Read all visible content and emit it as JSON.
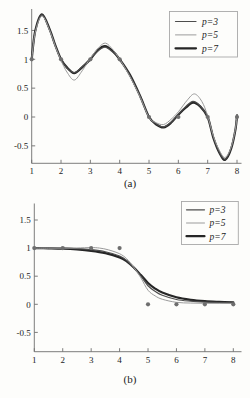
{
  "figure": {
    "background": "#fdfdfb",
    "colors": {
      "axis": "#6e6e6e",
      "tick_text": "#1c1c1c",
      "legend_border": "#a8a8a8",
      "legend_bg": "#fdfdfb",
      "dot": "#6e6e6e"
    }
  },
  "chart_data": [
    {
      "type": "line",
      "title": "",
      "xlabel": "",
      "ylabel": "",
      "caption": "(a)",
      "xlim": [
        1,
        8
      ],
      "ylim": [
        -0.8,
        1.85
      ],
      "grid": false,
      "legend_position": "upper right",
      "x_tick_labels": [
        "1",
        "2",
        "3",
        "4",
        "5",
        "6",
        "7",
        "8"
      ],
      "x_tick_values": [
        1,
        2,
        3,
        4,
        5,
        6,
        7,
        8
      ],
      "y_tick_labels": [
        "-0.5",
        "0",
        "0.5",
        "1",
        "1.5"
      ],
      "y_tick_values": [
        -0.5,
        0,
        0.5,
        1,
        1.5
      ],
      "scatter": {
        "x": [
          1,
          2,
          3,
          4,
          5,
          6,
          7,
          8
        ],
        "y": [
          1,
          1,
          1,
          1,
          0,
          0,
          0,
          0
        ]
      },
      "series": [
        {
          "name": "p=7",
          "color": "#262626",
          "width": 2.2,
          "points": [
            [
              1,
              1.0
            ],
            [
              1.12,
              1.49
            ],
            [
              1.35,
              1.78
            ],
            [
              1.62,
              1.51
            ],
            [
              1.8,
              1.25
            ],
            [
              2,
              1.0
            ],
            [
              2.2,
              0.86
            ],
            [
              2.45,
              0.76
            ],
            [
              2.7,
              0.85
            ],
            [
              3,
              1.0
            ],
            [
              3.25,
              1.16
            ],
            [
              3.5,
              1.23
            ],
            [
              3.75,
              1.15
            ],
            [
              4,
              1.0
            ],
            [
              4.35,
              0.73
            ],
            [
              4.7,
              0.36
            ],
            [
              5,
              0.0
            ],
            [
              5.25,
              -0.13
            ],
            [
              5.5,
              -0.18
            ],
            [
              5.75,
              -0.1
            ],
            [
              6,
              0.04
            ],
            [
              6.25,
              0.16
            ],
            [
              6.5,
              0.25
            ],
            [
              6.75,
              0.18
            ],
            [
              7,
              0.0
            ],
            [
              7.2,
              -0.37
            ],
            [
              7.42,
              -0.64
            ],
            [
              7.6,
              -0.74
            ],
            [
              7.8,
              -0.55
            ],
            [
              7.95,
              -0.21
            ],
            [
              8,
              0.03
            ]
          ]
        },
        {
          "name": "p=3",
          "color": "#4d4d4d",
          "width": 1.2,
          "points": [
            [
              1,
              1.0
            ],
            [
              1.12,
              1.48
            ],
            [
              1.35,
              1.77
            ],
            [
              1.62,
              1.5
            ],
            [
              1.8,
              1.24
            ],
            [
              2,
              1.0
            ],
            [
              2.2,
              0.85
            ],
            [
              2.45,
              0.77
            ],
            [
              2.7,
              0.86
            ],
            [
              3,
              1.01
            ],
            [
              3.25,
              1.14
            ],
            [
              3.5,
              1.21
            ],
            [
              3.75,
              1.13
            ],
            [
              4,
              1.0
            ],
            [
              4.35,
              0.72
            ],
            [
              4.7,
              0.36
            ],
            [
              5,
              0.0
            ],
            [
              5.25,
              -0.12
            ],
            [
              5.5,
              -0.17
            ],
            [
              5.75,
              -0.09
            ],
            [
              6,
              0.05
            ],
            [
              6.25,
              0.18
            ],
            [
              6.5,
              0.27
            ],
            [
              6.75,
              0.19
            ],
            [
              7,
              0.0
            ],
            [
              7.2,
              -0.36
            ],
            [
              7.42,
              -0.63
            ],
            [
              7.6,
              -0.73
            ],
            [
              7.8,
              -0.54
            ],
            [
              7.95,
              -0.2
            ],
            [
              8,
              0.03
            ]
          ]
        },
        {
          "name": "p=5",
          "color": "#9b9b9b",
          "width": 1.0,
          "points": [
            [
              1,
              1.0
            ],
            [
              1.12,
              1.46
            ],
            [
              1.35,
              1.75
            ],
            [
              1.62,
              1.49
            ],
            [
              1.8,
              1.23
            ],
            [
              2,
              0.98
            ],
            [
              2.2,
              0.78
            ],
            [
              2.45,
              0.64
            ],
            [
              2.72,
              0.8
            ],
            [
              3,
              1.02
            ],
            [
              3.3,
              1.21
            ],
            [
              3.52,
              1.28
            ],
            [
              3.76,
              1.17
            ],
            [
              4,
              1.0
            ],
            [
              4.35,
              0.7
            ],
            [
              4.7,
              0.34
            ],
            [
              5,
              -0.01
            ],
            [
              5.25,
              -0.1
            ],
            [
              5.5,
              -0.13
            ],
            [
              5.75,
              -0.04
            ],
            [
              6,
              0.09
            ],
            [
              6.3,
              0.29
            ],
            [
              6.55,
              0.4
            ],
            [
              6.8,
              0.27
            ],
            [
              7,
              0.02
            ],
            [
              7.2,
              -0.34
            ],
            [
              7.42,
              -0.6
            ],
            [
              7.6,
              -0.7
            ],
            [
              7.8,
              -0.52
            ],
            [
              7.95,
              -0.19
            ],
            [
              8,
              0.03
            ]
          ]
        }
      ],
      "legend": [
        {
          "label": "p=3",
          "color": "#4d4d4d",
          "width": 1.2
        },
        {
          "label": "p=5",
          "color": "#9b9b9b",
          "width": 1.0
        },
        {
          "label": "p=7",
          "color": "#262626",
          "width": 2.2
        }
      ]
    },
    {
      "type": "line",
      "title": "",
      "xlabel": "",
      "ylabel": "",
      "caption": "(b)",
      "xlim": [
        1,
        8
      ],
      "ylim": [
        -0.85,
        1.75
      ],
      "grid": false,
      "legend_position": "upper right",
      "x_tick_labels": [
        "1",
        "2",
        "3",
        "4",
        "5",
        "6",
        "7",
        "8"
      ],
      "x_tick_values": [
        1,
        2,
        3,
        4,
        5,
        6,
        7,
        8
      ],
      "y_tick_labels": [
        "-0.5",
        "0",
        "0.5",
        "1",
        "1.5"
      ],
      "y_tick_values": [
        -0.5,
        0,
        0.5,
        1,
        1.5
      ],
      "scatter": {
        "x": [
          1,
          2,
          3,
          4,
          5,
          6,
          7,
          8
        ],
        "y": [
          1,
          1,
          1,
          1,
          0,
          0,
          0,
          0
        ]
      },
      "series": [
        {
          "name": "p=7",
          "color": "#262626",
          "width": 2.2,
          "points": [
            [
              1,
              0.999
            ],
            [
              1.5,
              0.996
            ],
            [
              2,
              0.99
            ],
            [
              2.5,
              0.976
            ],
            [
              3,
              0.952
            ],
            [
              3.5,
              0.91
            ],
            [
              4,
              0.835
            ],
            [
              4.25,
              0.765
            ],
            [
              4.5,
              0.655
            ],
            [
              4.75,
              0.52
            ],
            [
              5,
              0.38
            ],
            [
              5.25,
              0.28
            ],
            [
              5.5,
              0.21
            ],
            [
              6,
              0.125
            ],
            [
              6.5,
              0.08
            ],
            [
              7,
              0.055
            ],
            [
              7.5,
              0.042
            ],
            [
              8,
              0.033
            ]
          ]
        },
        {
          "name": "p=3",
          "color": "#4d4d4d",
          "width": 1.2,
          "points": [
            [
              1,
              1.0
            ],
            [
              1.5,
              1.0
            ],
            [
              2,
              0.998
            ],
            [
              2.5,
              0.99
            ],
            [
              3,
              0.972
            ],
            [
              3.5,
              0.935
            ],
            [
              4,
              0.86
            ],
            [
              4.25,
              0.78
            ],
            [
              4.5,
              0.65
            ],
            [
              4.75,
              0.5
            ],
            [
              5,
              0.33
            ],
            [
              5.25,
              0.23
            ],
            [
              5.5,
              0.16
            ],
            [
              6,
              0.085
            ],
            [
              6.5,
              0.055
            ],
            [
              7,
              0.04
            ],
            [
              7.5,
              0.032
            ],
            [
              8,
              0.03
            ]
          ]
        },
        {
          "name": "p=5",
          "color": "#9b9b9b",
          "width": 1.0,
          "points": [
            [
              1,
              1.0
            ],
            [
              1.5,
              1.0
            ],
            [
              2,
              1.0
            ],
            [
              2.5,
              1.002
            ],
            [
              3,
              1.01
            ],
            [
              3.3,
              1.0
            ],
            [
              3.6,
              0.97
            ],
            [
              4,
              0.9
            ],
            [
              4.25,
              0.81
            ],
            [
              4.5,
              0.66
            ],
            [
              4.75,
              0.47
            ],
            [
              5,
              0.25
            ],
            [
              5.25,
              0.15
            ],
            [
              5.5,
              0.09
            ],
            [
              6,
              0.035
            ],
            [
              6.5,
              0.022
            ],
            [
              7,
              0.018
            ],
            [
              7.5,
              0.016
            ],
            [
              8,
              0.015
            ]
          ]
        }
      ],
      "legend": [
        {
          "label": "p=3",
          "color": "#4d4d4d",
          "width": 1.2
        },
        {
          "label": "p=5",
          "color": "#9b9b9b",
          "width": 1.0
        },
        {
          "label": "p=7",
          "color": "#262626",
          "width": 2.2
        }
      ]
    }
  ]
}
